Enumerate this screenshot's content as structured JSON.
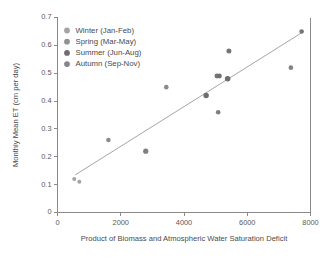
{
  "chart_data": {
    "type": "scatter",
    "title": "",
    "xlabel": "Product of Biomass and Atmospheric Water Saturation Deficit",
    "ylabel": "Monthly Mean ET (cm per day)",
    "xlim": [
      0,
      8000
    ],
    "ylim": [
      0,
      0.7
    ],
    "xticks": [
      0,
      2000,
      4000,
      6000,
      8000
    ],
    "yticks": [
      0,
      0.1,
      0.2,
      0.3,
      0.4,
      0.5,
      0.6,
      0.7
    ],
    "xtick_labels": [
      "0",
      "2000",
      "4000",
      "6000",
      "8000"
    ],
    "ytick_labels": [
      "0",
      "0.1",
      "0.2",
      "0.3",
      "0.4",
      "0.5",
      "0.6",
      "0.7"
    ],
    "grid": false,
    "legend_position": "top-left",
    "legend": [
      {
        "label": "Winter (Jan-Feb)",
        "color": "#a3a3a5"
      },
      {
        "label": "Spring (Mar-May)",
        "color": "#919193"
      },
      {
        "label": "Summer (Jun-Aug)",
        "color": "#6e6e70"
      },
      {
        "label": "Autumn (Sep-Nov)",
        "color": "#858587"
      }
    ],
    "points": [
      {
        "x": 530,
        "y": 0.12,
        "season": "Winter (Jan-Feb)",
        "color": "#a3a3a5",
        "r": 2.0
      },
      {
        "x": 690,
        "y": 0.11,
        "season": "Winter (Jan-Feb)",
        "color": "#a3a3a5",
        "r": 2.0
      },
      {
        "x": 1610,
        "y": 0.26,
        "season": "Spring (Mar-May)",
        "color": "#8b8b8d",
        "r": 2.3
      },
      {
        "x": 2790,
        "y": 0.22,
        "season": "Autumn (Sep-Nov)",
        "color": "#7f7f81",
        "r": 2.6
      },
      {
        "x": 3440,
        "y": 0.45,
        "season": "Spring (Mar-May)",
        "color": "#8b8b8d",
        "r": 2.3
      },
      {
        "x": 4700,
        "y": 0.42,
        "season": "Summer (Jun-Aug)",
        "color": "#6e6e70",
        "r": 2.7
      },
      {
        "x": 5040,
        "y": 0.49,
        "season": "Summer (Jun-Aug)",
        "color": "#757577",
        "r": 2.4
      },
      {
        "x": 5120,
        "y": 0.49,
        "season": "Summer (Jun-Aug)",
        "color": "#6e6e70",
        "r": 2.4
      },
      {
        "x": 5080,
        "y": 0.36,
        "season": "Autumn (Sep-Nov)",
        "color": "#7f7f81",
        "r": 2.3
      },
      {
        "x": 5380,
        "y": 0.48,
        "season": "Summer (Jun-Aug)",
        "color": "#6e6e70",
        "r": 2.8
      },
      {
        "x": 5420,
        "y": 0.58,
        "season": "Summer (Jun-Aug)",
        "color": "#757577",
        "r": 2.5
      },
      {
        "x": 7380,
        "y": 0.52,
        "season": "Autumn (Sep-Nov)",
        "color": "#828284",
        "r": 2.3
      },
      {
        "x": 7720,
        "y": 0.65,
        "season": "Summer (Jun-Aug)",
        "color": "#757577",
        "r": 2.3
      }
    ],
    "trend_line": {
      "x_start": 560,
      "y_start": 0.135,
      "x_end": 7760,
      "y_end": 0.648,
      "color": "#a6a6a8"
    }
  }
}
